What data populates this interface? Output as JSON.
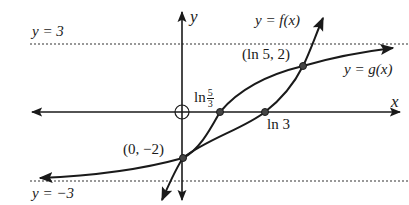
{
  "diagram": {
    "axes": {
      "x_label": "x",
      "y_label": "y",
      "origin_marker": "open-circle-crosshair"
    },
    "asymptotes": [
      {
        "label": "y = 3",
        "y": 3,
        "style": "dotted"
      },
      {
        "label": "y = −3",
        "y": -3,
        "style": "dotted"
      }
    ],
    "curves": [
      {
        "name": "f",
        "label": "y = f(x)",
        "shape": "steep increasing, passes (0,-2), (ln 3, 0), (ln 5, 2)"
      },
      {
        "name": "g",
        "label": "y = g(x)",
        "shape": "increasing between asymptotes y=-3 and y=3, passes (0,-2), (ln 5/3, 0), (ln 5, 2)"
      }
    ],
    "points": [
      {
        "label": "(0, −2)",
        "x": "0",
        "y": -2
      },
      {
        "label": "(ln 5, 2)",
        "x": "ln 5",
        "y": 2
      },
      {
        "label": "ln 3",
        "x": "ln 3",
        "y": 0
      },
      {
        "label": "ln 5/3",
        "x": "ln 5/3",
        "y": 0
      }
    ],
    "labels": {
      "y_eq_3": "y = 3",
      "y_eq_neg3": "y = −3",
      "f_label": "y = f(x)",
      "g_label": "y = g(x)",
      "point_ln5_2": "(ln 5, 2)",
      "point_0_neg2": "(0, −2)",
      "ln3": "ln 3",
      "ln_prefix": "ln",
      "frac_num": "5",
      "frac_den": "3",
      "x_axis": "x",
      "y_axis": "y"
    },
    "colors": {
      "ink": "#1a1a1a",
      "point_fill": "#444444",
      "background": "#ffffff"
    }
  }
}
